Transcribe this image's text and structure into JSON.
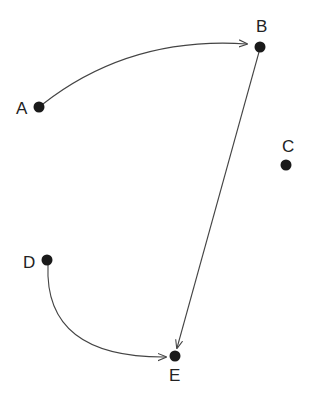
{
  "diagram": {
    "type": "directed-graph",
    "colors": {
      "node": "#1a1a1a",
      "edge": "#444444",
      "label": "#222222",
      "background": "#ffffff"
    },
    "nodes": [
      {
        "id": "A",
        "label": "A",
        "x": 39,
        "y": 107,
        "label_x": 16,
        "label_y": 114
      },
      {
        "id": "B",
        "label": "B",
        "x": 260,
        "y": 47,
        "label_x": 256,
        "label_y": 32
      },
      {
        "id": "C",
        "label": "C",
        "x": 286,
        "y": 165,
        "label_x": 282,
        "label_y": 152
      },
      {
        "id": "D",
        "label": "D",
        "x": 47,
        "y": 260,
        "label_x": 23,
        "label_y": 268
      },
      {
        "id": "E",
        "label": "E",
        "x": 175,
        "y": 356,
        "label_x": 169,
        "label_y": 381
      }
    ],
    "edges": [
      {
        "from": "A",
        "to": "B",
        "shape": "curved",
        "path": "M 43 104 Q 130 36 247 44"
      },
      {
        "from": "B",
        "to": "E",
        "shape": "straight",
        "path": "M 259 52 L 177 348"
      },
      {
        "from": "D",
        "to": "E",
        "shape": "curved",
        "path": "M 48 265 Q 44 358 166 357"
      }
    ]
  }
}
